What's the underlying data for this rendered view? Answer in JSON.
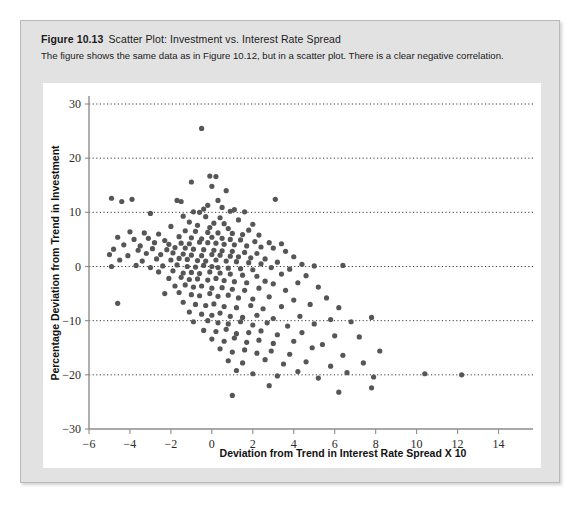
{
  "figure": {
    "number": "Figure 10.13",
    "title": "Scatter Plot: Investment vs. Interest Rate Spread",
    "subtitle": "The figure shows the same data as in Figure 10.12, but in a scatter plot. There is a clear negative correlation."
  },
  "colors": {
    "card_background": "#e2e2e2",
    "panel_background": "#ffffff",
    "point_fill": "#565656",
    "axis": "#8d8d8d",
    "grid": "#3a3a3a",
    "text": "#1b1b1b"
  },
  "chart_data": {
    "type": "scatter",
    "title": "Scatter Plot: Investment vs. Interest Rate Spread",
    "xlabel": "Deviation from Trend in Interest Rate Spread X 10",
    "ylabel": "Percentage Deviation from Trend in Investment",
    "xlim": [
      -6,
      15
    ],
    "ylim": [
      -30,
      30
    ],
    "xticks": [
      -6,
      -4,
      -2,
      0,
      2,
      4,
      6,
      8,
      10,
      12,
      14
    ],
    "xtick_labels": [
      "-6",
      "-4",
      "-2",
      "0",
      "2",
      "4",
      "6",
      "8",
      "10",
      "12",
      "14"
    ],
    "yticks": [
      -30,
      -20,
      -10,
      0,
      10,
      20,
      30
    ],
    "ytick_labels": [
      "-30",
      "-20",
      "-10",
      "0",
      "10",
      "20",
      "30"
    ],
    "grid": "horizontal-dotted",
    "legend": null,
    "annotations": [
      "There is a clear negative correlation."
    ],
    "marker": {
      "shape": "circle",
      "radius": 2.6,
      "color": "#565656"
    },
    "points": [
      [
        -0.5,
        25.5
      ],
      [
        -0.1,
        16.7
      ],
      [
        0.2,
        16.6
      ],
      [
        -1.0,
        15.6
      ],
      [
        0.0,
        14.8
      ],
      [
        0.7,
        14.0
      ],
      [
        -4.9,
        12.6
      ],
      [
        -4.4,
        12.0
      ],
      [
        -3.9,
        12.4
      ],
      [
        -1.7,
        12.2
      ],
      [
        -1.5,
        12.0
      ],
      [
        0.3,
        12.2
      ],
      [
        3.1,
        12.4
      ],
      [
        -0.2,
        11.3
      ],
      [
        0.5,
        10.9
      ],
      [
        -0.4,
        10.6
      ],
      [
        1.1,
        10.5
      ],
      [
        -3.0,
        9.8
      ],
      [
        -0.6,
        10.0
      ],
      [
        -0.9,
        10.1
      ],
      [
        0.9,
        10.2
      ],
      [
        1.6,
        10.1
      ],
      [
        -1.4,
        9.3
      ],
      [
        -0.3,
        9.2
      ],
      [
        0.4,
        9.0
      ],
      [
        1.3,
        8.6
      ],
      [
        -1.1,
        8.2
      ],
      [
        0.1,
        8.0
      ],
      [
        0.6,
        7.9
      ],
      [
        2.0,
        7.8
      ],
      [
        -2.0,
        7.4
      ],
      [
        -0.7,
        7.6
      ],
      [
        -0.1,
        7.2
      ],
      [
        0.8,
        7.0
      ],
      [
        1.8,
        6.7
      ],
      [
        -4.0,
        6.4
      ],
      [
        -3.3,
        6.2
      ],
      [
        -2.6,
        6.0
      ],
      [
        -1.3,
        6.6
      ],
      [
        -0.8,
        6.5
      ],
      [
        -0.2,
        6.3
      ],
      [
        0.3,
        6.2
      ],
      [
        1.0,
        6.1
      ],
      [
        1.5,
        5.9
      ],
      [
        2.3,
        5.8
      ],
      [
        -4.6,
        5.4
      ],
      [
        -3.8,
        5.0
      ],
      [
        -3.1,
        5.2
      ],
      [
        -2.3,
        4.8
      ],
      [
        -1.6,
        5.5
      ],
      [
        -1.0,
        5.3
      ],
      [
        -0.5,
        5.1
      ],
      [
        0.0,
        5.4
      ],
      [
        0.5,
        5.2
      ],
      [
        0.9,
        5.0
      ],
      [
        1.4,
        4.9
      ],
      [
        2.1,
        4.6
      ],
      [
        2.8,
        4.4
      ],
      [
        3.4,
        4.2
      ],
      [
        -4.3,
        4.0
      ],
      [
        -3.5,
        3.8
      ],
      [
        -2.8,
        4.4
      ],
      [
        -2.1,
        4.1
      ],
      [
        -1.5,
        4.3
      ],
      [
        -1.1,
        4.2
      ],
      [
        -0.6,
        4.5
      ],
      [
        -0.2,
        4.4
      ],
      [
        0.2,
        4.3
      ],
      [
        0.6,
        4.1
      ],
      [
        1.1,
        4.0
      ],
      [
        1.7,
        3.8
      ],
      [
        2.4,
        3.6
      ],
      [
        3.0,
        3.4
      ],
      [
        -4.8,
        3.2
      ],
      [
        -3.6,
        3.0
      ],
      [
        -2.9,
        3.3
      ],
      [
        -2.2,
        3.1
      ],
      [
        -1.8,
        3.5
      ],
      [
        -1.3,
        3.4
      ],
      [
        -0.9,
        3.2
      ],
      [
        -0.4,
        3.1
      ],
      [
        0.1,
        3.0
      ],
      [
        0.5,
        2.9
      ],
      [
        1.0,
        2.8
      ],
      [
        1.6,
        2.6
      ],
      [
        2.2,
        2.4
      ],
      [
        3.6,
        2.8
      ],
      [
        -5.0,
        2.2
      ],
      [
        -4.1,
        2.0
      ],
      [
        -3.2,
        2.4
      ],
      [
        -2.5,
        2.2
      ],
      [
        -1.9,
        2.5
      ],
      [
        -1.4,
        2.3
      ],
      [
        -1.0,
        2.1
      ],
      [
        -0.5,
        2.0
      ],
      [
        0.0,
        2.2
      ],
      [
        0.4,
        2.1
      ],
      [
        0.9,
        1.9
      ],
      [
        1.3,
        1.8
      ],
      [
        1.9,
        1.6
      ],
      [
        2.6,
        1.4
      ],
      [
        4.0,
        1.8
      ],
      [
        -4.5,
        1.2
      ],
      [
        -3.4,
        1.0
      ],
      [
        -2.7,
        1.4
      ],
      [
        -2.0,
        1.2
      ],
      [
        -1.6,
        1.5
      ],
      [
        -1.2,
        1.3
      ],
      [
        -0.7,
        1.1
      ],
      [
        -0.3,
        1.0
      ],
      [
        0.2,
        1.2
      ],
      [
        0.7,
        1.0
      ],
      [
        1.2,
        0.9
      ],
      [
        1.8,
        0.7
      ],
      [
        2.4,
        0.5
      ],
      [
        3.2,
        0.8
      ],
      [
        4.4,
        0.4
      ],
      [
        6.4,
        0.2
      ],
      [
        -4.9,
        0.0
      ],
      [
        -3.7,
        0.2
      ],
      [
        -3.0,
        -0.2
      ],
      [
        -2.4,
        0.1
      ],
      [
        -1.7,
        0.3
      ],
      [
        -1.2,
        0.0
      ],
      [
        -0.8,
        -0.1
      ],
      [
        -0.4,
        0.2
      ],
      [
        0.0,
        0.0
      ],
      [
        0.3,
        -0.2
      ],
      [
        0.8,
        -0.3
      ],
      [
        1.4,
        -0.4
      ],
      [
        2.0,
        -0.6
      ],
      [
        2.9,
        -0.2
      ],
      [
        3.8,
        -0.5
      ],
      [
        5.0,
        0.1
      ],
      [
        -2.6,
        -1.0
      ],
      [
        -1.9,
        -0.8
      ],
      [
        -1.4,
        -1.2
      ],
      [
        -1.0,
        -1.1
      ],
      [
        -0.6,
        -1.3
      ],
      [
        -0.1,
        -1.0
      ],
      [
        0.4,
        -1.2
      ],
      [
        0.9,
        -1.4
      ],
      [
        1.5,
        -1.6
      ],
      [
        2.2,
        -1.8
      ],
      [
        3.4,
        -1.4
      ],
      [
        4.6,
        -1.7
      ],
      [
        -2.1,
        -2.2
      ],
      [
        -1.5,
        -2.0
      ],
      [
        -1.1,
        -2.4
      ],
      [
        -0.7,
        -2.3
      ],
      [
        -0.2,
        -2.5
      ],
      [
        0.2,
        -2.2
      ],
      [
        0.6,
        -2.6
      ],
      [
        1.1,
        -2.8
      ],
      [
        1.7,
        -3.0
      ],
      [
        2.6,
        -2.7
      ],
      [
        3.0,
        -3.2
      ],
      [
        4.2,
        -3.0
      ],
      [
        -1.8,
        -3.6
      ],
      [
        -1.3,
        -3.4
      ],
      [
        -0.9,
        -3.8
      ],
      [
        -0.5,
        -3.6
      ],
      [
        0.0,
        -4.0
      ],
      [
        0.5,
        -3.9
      ],
      [
        1.0,
        -4.2
      ],
      [
        1.6,
        -4.4
      ],
      [
        2.3,
        -4.0
      ],
      [
        3.6,
        -4.4
      ],
      [
        5.2,
        -3.8
      ],
      [
        -2.3,
        -5.0
      ],
      [
        -1.6,
        -4.8
      ],
      [
        -1.0,
        -5.2
      ],
      [
        -0.6,
        -5.4
      ],
      [
        -0.1,
        -5.0
      ],
      [
        0.3,
        -5.5
      ],
      [
        0.8,
        -5.3
      ],
      [
        1.3,
        -5.8
      ],
      [
        2.0,
        -6.0
      ],
      [
        2.8,
        -5.6
      ],
      [
        4.0,
        -6.2
      ],
      [
        5.6,
        -5.8
      ],
      [
        -4.6,
        -6.8
      ],
      [
        -1.4,
        -6.6
      ],
      [
        -0.8,
        -7.0
      ],
      [
        -0.3,
        -7.2
      ],
      [
        0.1,
        -6.9
      ],
      [
        0.6,
        -7.4
      ],
      [
        1.2,
        -7.6
      ],
      [
        1.9,
        -7.2
      ],
      [
        2.5,
        -7.8
      ],
      [
        3.4,
        -7.4
      ],
      [
        4.8,
        -7.0
      ],
      [
        6.2,
        -7.6
      ],
      [
        -1.1,
        -8.4
      ],
      [
        -0.5,
        -8.8
      ],
      [
        0.0,
        -9.0
      ],
      [
        0.4,
        -8.6
      ],
      [
        0.9,
        -9.2
      ],
      [
        1.5,
        -9.4
      ],
      [
        2.2,
        -9.0
      ],
      [
        3.0,
        -9.6
      ],
      [
        4.3,
        -9.2
      ],
      [
        5.8,
        -9.8
      ],
      [
        7.8,
        -9.4
      ],
      [
        -0.9,
        -10.2
      ],
      [
        -0.2,
        -10.0
      ],
      [
        0.3,
        -10.4
      ],
      [
        0.8,
        -10.6
      ],
      [
        1.4,
        -10.2
      ],
      [
        2.0,
        -10.8
      ],
      [
        2.7,
        -10.4
      ],
      [
        3.7,
        -11.0
      ],
      [
        5.0,
        -10.6
      ],
      [
        6.8,
        -10.2
      ],
      [
        -0.4,
        -11.8
      ],
      [
        0.2,
        -12.0
      ],
      [
        0.7,
        -11.6
      ],
      [
        1.2,
        -12.4
      ],
      [
        1.8,
        -12.2
      ],
      [
        2.4,
        -11.9
      ],
      [
        3.2,
        -12.6
      ],
      [
        4.4,
        -12.2
      ],
      [
        6.0,
        -12.8
      ],
      [
        0.0,
        -13.4
      ],
      [
        0.6,
        -13.8
      ],
      [
        1.1,
        -13.2
      ],
      [
        1.7,
        -14.0
      ],
      [
        2.3,
        -13.6
      ],
      [
        3.0,
        -14.2
      ],
      [
        4.0,
        -13.8
      ],
      [
        5.4,
        -14.4
      ],
      [
        7.2,
        -13.0
      ],
      [
        0.4,
        -15.2
      ],
      [
        1.0,
        -15.8
      ],
      [
        1.6,
        -15.4
      ],
      [
        2.2,
        -16.0
      ],
      [
        2.9,
        -15.6
      ],
      [
        3.8,
        -16.2
      ],
      [
        4.9,
        -15.0
      ],
      [
        6.4,
        -16.4
      ],
      [
        8.2,
        -15.6
      ],
      [
        0.8,
        -17.4
      ],
      [
        1.5,
        -17.8
      ],
      [
        2.6,
        -17.2
      ],
      [
        3.5,
        -18.0
      ],
      [
        4.6,
        -17.6
      ],
      [
        5.8,
        -18.4
      ],
      [
        7.4,
        -17.8
      ],
      [
        1.2,
        -19.2
      ],
      [
        2.0,
        -19.8
      ],
      [
        3.2,
        -20.2
      ],
      [
        4.2,
        -19.4
      ],
      [
        5.2,
        -20.6
      ],
      [
        6.6,
        -19.6
      ],
      [
        7.9,
        -20.4
      ],
      [
        10.4,
        -19.8
      ],
      [
        12.2,
        -20.0
      ],
      [
        1.0,
        -23.8
      ],
      [
        2.8,
        -22.0
      ],
      [
        6.2,
        -23.2
      ],
      [
        7.8,
        -22.4
      ]
    ]
  }
}
